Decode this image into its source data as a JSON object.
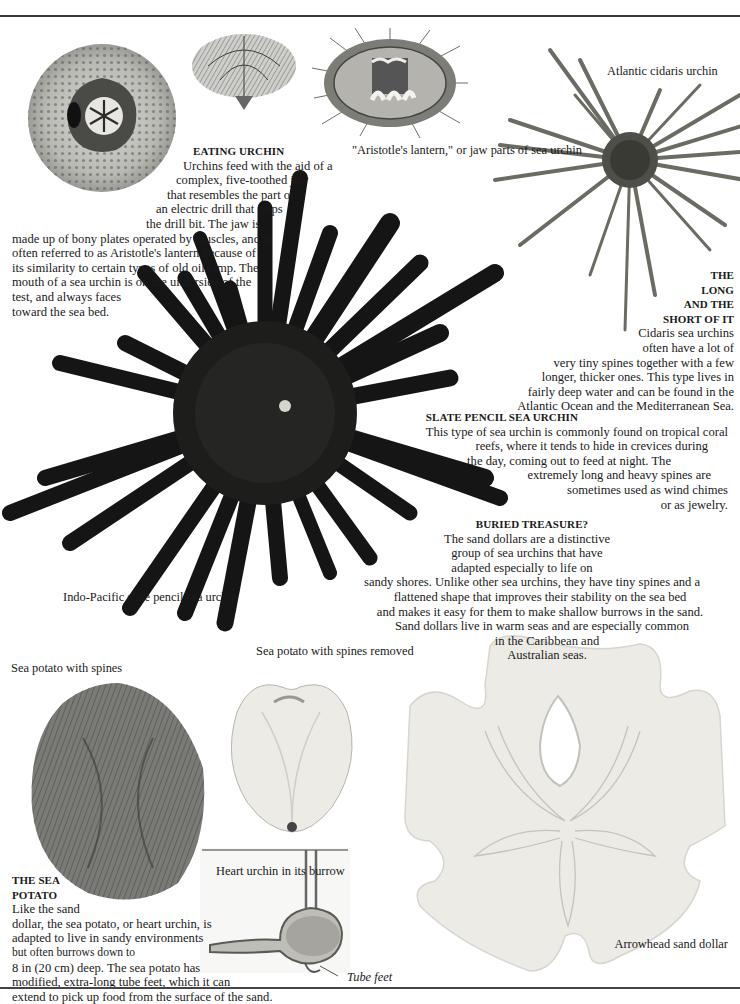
{
  "page": {
    "rules": [
      "top",
      "bottom"
    ]
  },
  "eating_urchin": {
    "heading": "EATING URCHIN",
    "lines": [
      "Urchins feed with the aid of a",
      "complex, five-toothed jaw",
      "that resembles the part of",
      "an electric drill that grips",
      "the drill bit. The jaw is",
      "made up of bony plates  operated by muscles, and is",
      "often referred to as Aristotle's lantern because of",
      "its similarity to certain types of old oil lamp. The",
      "mouth of a sea urchin is on the underside of the",
      "test, and always faces",
      "toward the sea bed."
    ]
  },
  "captions": {
    "aristotles_lantern": [
      "\"Aristotle's",
      "lantern,\" or jaw",
      "parts of",
      "sea urchin"
    ],
    "atlantic_cidaris": [
      "Atlantic  cidaris",
      "urchin"
    ],
    "indo_pacific": [
      "Indo-Pacific",
      "slate pencil",
      "sea urchin"
    ],
    "sea_potato_spines": [
      "Sea  potato",
      "with spines"
    ],
    "sea_potato_removed": [
      "Sea  potato  with",
      "spines removed"
    ],
    "heart_urchin": [
      "Heart  urchin",
      "in its burrow"
    ],
    "tube_feet": "Tube  feet",
    "arrowhead": [
      "Arrowhead",
      "sand dollar"
    ]
  },
  "long_short": {
    "heading_lines": [
      "THE",
      "LONG",
      "AND THE",
      "SHORT OF IT"
    ],
    "lines": [
      "Cidaris sea urchins",
      "often have a lot of",
      "very tiny spines together with a few",
      "longer, thicker ones. This type lives in",
      "fairly deep water and can be found in the",
      "Atlantic Ocean and the Mediterranean Sea."
    ]
  },
  "slate_pencil": {
    "heading": "SLATE PENCIL SEA URCHIN",
    "lines": [
      "This type of sea urchin is commonly found on  tropical coral",
      "reefs, where it tends to hide in crevices during",
      "the day, coming out to feed at night. The",
      "extremely long and heavy spines are",
      "sometimes used as wind chimes",
      "or as jewelry."
    ]
  },
  "buried_treasure": {
    "heading": "BURIED TREASURE?",
    "lines": [
      "The sand dollars are a distinctive",
      "group of sea urchins that have",
      "adapted especially to life on",
      "sandy shores. Unlike other sea urchins, they have tiny spines and a",
      "flattened shape that improves their stability on the sea bed",
      "and makes it easy for them to make shallow  burrows in the sand.",
      "Sand dollars live in warm seas and are especially  common",
      "in the Caribbean and",
      "Australian seas."
    ]
  },
  "sea_potato": {
    "heading_lines": [
      "THE SEA",
      "POTATO"
    ],
    "lines": [
      "Like the sand",
      "dollar, the sea potato, or heart urchin, is",
      "adapted to live in sandy environments",
      "but often burrows down to",
      "8 in (20 cm) deep. The sea potato has",
      "modified, extra-long tube feet, which it can",
      "extend to pick up food from the surface of the sand."
    ]
  },
  "colors": {
    "ink": "#1a1a1a",
    "urchin_dark": "#141414",
    "cidaris_spine": "#6b6b63",
    "sand_dollar": "#ecebe6",
    "sea_potato_fur": "#6a6a66",
    "rule": "#3a3a3a"
  }
}
